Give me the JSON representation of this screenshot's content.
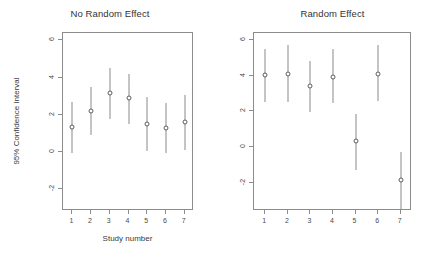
{
  "figure": {
    "x_axis_title": "Study number",
    "y_axis_title": "95% Confidence Interval"
  },
  "panels": {
    "left_title": "No Random Effect",
    "right_title": "Random Effect"
  },
  "chart_data": [
    {
      "type": "scatter",
      "title": "No Random Effect",
      "xlabel": "Study number",
      "ylabel": "95% Confidence Interval",
      "xlim": [
        0.5,
        7.5
      ],
      "ylim": [
        -3.2,
        6.4
      ],
      "grid": false,
      "legend": null,
      "x": [
        1,
        2,
        3,
        4,
        5,
        6,
        7
      ],
      "xtick_labels": [
        "1",
        "2",
        "3",
        "4",
        "5",
        "6",
        "7"
      ],
      "ytick_values": [
        6,
        4,
        2,
        0,
        -2
      ],
      "ytick_labels": [
        "6",
        "4",
        "2",
        "0",
        "-2"
      ],
      "series": [
        {
          "name": "Point estimate",
          "values": [
            1.35,
            2.2,
            3.15,
            2.9,
            1.5,
            1.3,
            1.6
          ]
        },
        {
          "name": "Lower 95% CI",
          "values": [
            -0.05,
            0.9,
            1.75,
            1.5,
            0.05,
            -0.05,
            0.1
          ]
        },
        {
          "name": "Upper 95% CI",
          "values": [
            2.7,
            3.5,
            4.5,
            4.2,
            2.95,
            2.6,
            3.05
          ]
        }
      ]
    },
    {
      "type": "scatter",
      "title": "Random Effect",
      "xlabel": "Study number",
      "ylabel": "95% Confidence Interval",
      "xlim": [
        0.5,
        7.5
      ],
      "ylim": [
        -3.6,
        6.4
      ],
      "grid": false,
      "legend": null,
      "x": [
        1,
        2,
        3,
        4,
        5,
        6,
        7
      ],
      "xtick_labels": [
        "1",
        "2",
        "3",
        "4",
        "5",
        "6",
        "7"
      ],
      "ytick_values": [
        6,
        4,
        2,
        0,
        -2
      ],
      "ytick_labels": [
        "6",
        "4",
        "2",
        "0",
        "-2"
      ],
      "series": [
        {
          "name": "Point estimate",
          "values": [
            4.05,
            4.1,
            3.45,
            3.95,
            0.35,
            4.1,
            -1.85
          ]
        },
        {
          "name": "Lower 95% CI",
          "values": [
            2.5,
            2.55,
            1.95,
            2.45,
            -1.3,
            2.6,
            -3.5
          ]
        },
        {
          "name": "Upper 95% CI",
          "values": [
            5.5,
            5.7,
            4.85,
            5.5,
            1.85,
            5.75,
            -0.3
          ]
        }
      ]
    }
  ]
}
